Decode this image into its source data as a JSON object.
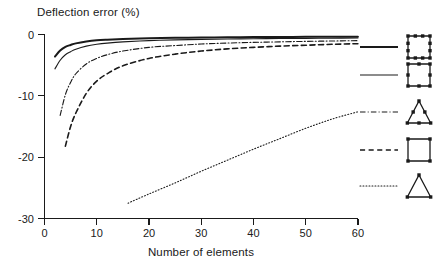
{
  "chart_data": {
    "type": "line",
    "title": "",
    "xlabel": "Number of elements",
    "ylabel": "Deflection error (%)",
    "xlim": [
      0,
      60
    ],
    "ylim": [
      -30,
      0
    ],
    "xticks": [
      0,
      10,
      20,
      30,
      40,
      50,
      60
    ],
    "yticks": [
      0,
      -10,
      -20,
      -30
    ],
    "xtick_labels": [
      "0",
      "10",
      "20",
      "30",
      "40",
      "50",
      "60"
    ],
    "ytick_labels": [
      "0",
      "-10",
      "-20",
      "-30"
    ],
    "grid": false,
    "legend_position": "right-outside",
    "series": [
      {
        "name": "12-node quadrilateral (cubic)",
        "legend_symbol": "square-12-node",
        "line_style": "solid",
        "line_width": 2.0,
        "color": "#1a1a1a",
        "x": [
          2,
          3,
          4,
          5,
          6,
          8,
          10,
          12,
          15,
          20,
          25,
          30,
          35,
          40,
          45,
          50,
          55,
          60
        ],
        "y": [
          -3.6,
          -2.6,
          -2.0,
          -1.7,
          -1.45,
          -1.15,
          -0.95,
          -0.85,
          -0.75,
          -0.62,
          -0.55,
          -0.5,
          -0.45,
          -0.42,
          -0.4,
          -0.38,
          -0.36,
          -0.35
        ]
      },
      {
        "name": "8-node quadrilateral (quadratic)",
        "legend_symbol": "square-8-node",
        "line_style": "solid",
        "line_width": 1.1,
        "color": "#1a1a1a",
        "x": [
          2,
          3,
          4,
          5,
          6,
          8,
          10,
          12,
          15,
          20,
          25,
          30,
          35,
          40,
          45,
          50,
          55,
          60
        ],
        "y": [
          -5.6,
          -4.2,
          -3.3,
          -2.8,
          -2.4,
          -1.9,
          -1.6,
          -1.4,
          -1.2,
          -1.0,
          -0.88,
          -0.8,
          -0.74,
          -0.7,
          -0.66,
          -0.63,
          -0.6,
          -0.58
        ]
      },
      {
        "name": "6-node triangle (quadratic)",
        "legend_symbol": "triangle-6-node",
        "line_style": "dash-dot",
        "line_width": 1.1,
        "color": "#1a1a1a",
        "x": [
          3,
          4,
          5,
          6,
          8,
          10,
          12,
          15,
          20,
          25,
          30,
          35,
          40,
          45,
          50,
          55,
          60
        ],
        "y": [
          -13.2,
          -9.8,
          -7.8,
          -6.4,
          -4.8,
          -3.9,
          -3.3,
          -2.7,
          -2.1,
          -1.8,
          -1.55,
          -1.4,
          -1.28,
          -1.2,
          -1.12,
          -1.06,
          -1.0
        ]
      },
      {
        "name": "4-node quadrilateral (linear)",
        "legend_symbol": "square-4-node",
        "line_style": "dashed",
        "line_width": 1.6,
        "color": "#1a1a1a",
        "x": [
          4,
          5,
          6,
          8,
          10,
          12,
          15,
          20,
          25,
          30,
          35,
          40,
          45,
          50,
          55,
          60
        ],
        "y": [
          -18.2,
          -15.0,
          -12.8,
          -9.6,
          -7.6,
          -6.4,
          -5.1,
          -3.9,
          -3.2,
          -2.7,
          -2.35,
          -2.1,
          -1.9,
          -1.75,
          -1.6,
          -1.5
        ]
      },
      {
        "name": "3-node triangle (linear)",
        "legend_symbol": "triangle-3-node",
        "line_style": "dotted",
        "line_width": 1.1,
        "color": "#1a1a1a",
        "x": [
          16,
          20,
          25,
          30,
          35,
          40,
          45,
          50,
          55,
          60
        ],
        "y": [
          -27.5,
          -26.0,
          -24.2,
          -22.3,
          -20.5,
          -18.7,
          -17.0,
          -15.3,
          -13.8,
          -12.6
        ]
      }
    ]
  },
  "axes": {
    "y_title": "Deflection error (%)",
    "x_title": "Number of elements"
  },
  "legend": {
    "items": [
      {
        "id": "legend-item-1",
        "line_style": "solid",
        "symbol": "square-12-node",
        "label": ""
      },
      {
        "id": "legend-item-2",
        "line_style": "solid",
        "symbol": "square-8-node",
        "label": ""
      },
      {
        "id": "legend-item-3",
        "line_style": "dash-dot",
        "symbol": "triangle-6-node",
        "label": ""
      },
      {
        "id": "legend-item-4",
        "line_style": "dashed",
        "symbol": "square-4-node",
        "label": ""
      },
      {
        "id": "legend-item-5",
        "line_style": "dotted",
        "symbol": "triangle-3-node",
        "label": ""
      }
    ]
  },
  "colors": {
    "ink": "#1a1a1a",
    "background": "#ffffff"
  }
}
